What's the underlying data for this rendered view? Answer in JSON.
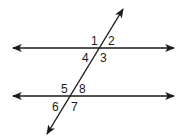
{
  "diagram": {
    "line_color": "#1a1a1a",
    "angles": [
      {
        "id": 1,
        "label": "1"
      },
      {
        "id": 2,
        "label": "2"
      },
      {
        "id": 3,
        "label": "3"
      },
      {
        "id": 4,
        "label": "4"
      },
      {
        "id": 5,
        "label": "5"
      },
      {
        "id": 6,
        "label": "6"
      },
      {
        "id": 7,
        "label": "7"
      },
      {
        "id": 8,
        "label": "8"
      }
    ]
  }
}
